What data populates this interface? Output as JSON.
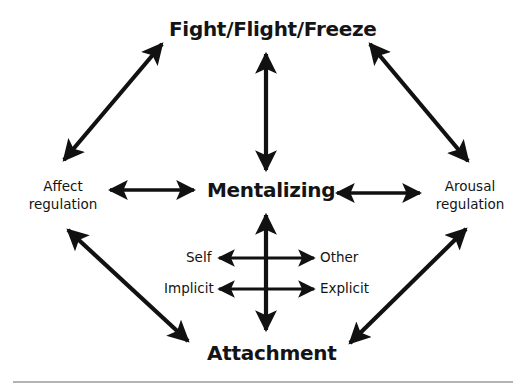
{
  "diagram": {
    "nodes": {
      "top": "Fight/Flight/Freeze",
      "center": "Mentalizing",
      "bottom": "Attachment",
      "left_line1": "Affect",
      "left_line2": "regulation",
      "right_line1": "Arousal",
      "right_line2": "regulation"
    },
    "dimensions": {
      "self": "Self",
      "other": "Other",
      "implicit": "Implicit",
      "explicit": "Explicit"
    },
    "edges": [
      {
        "from": "Fight/Flight/Freeze",
        "to": "Affect regulation",
        "type": "bidirectional"
      },
      {
        "from": "Fight/Flight/Freeze",
        "to": "Arousal regulation",
        "type": "bidirectional"
      },
      {
        "from": "Fight/Flight/Freeze",
        "to": "Mentalizing",
        "type": "bidirectional"
      },
      {
        "from": "Affect regulation",
        "to": "Mentalizing",
        "type": "bidirectional"
      },
      {
        "from": "Mentalizing",
        "to": "Arousal regulation",
        "type": "bidirectional"
      },
      {
        "from": "Mentalizing",
        "to": "Attachment",
        "type": "bidirectional"
      },
      {
        "from": "Affect regulation",
        "to": "Attachment",
        "type": "bidirectional"
      },
      {
        "from": "Arousal regulation",
        "to": "Attachment",
        "type": "bidirectional"
      },
      {
        "from": "Self",
        "to": "Other",
        "type": "bidirectional"
      },
      {
        "from": "Implicit",
        "to": "Explicit",
        "type": "bidirectional"
      }
    ],
    "colors": {
      "ink": "#111111",
      "background": "#ffffff",
      "rule": "#9a9a9a"
    }
  }
}
